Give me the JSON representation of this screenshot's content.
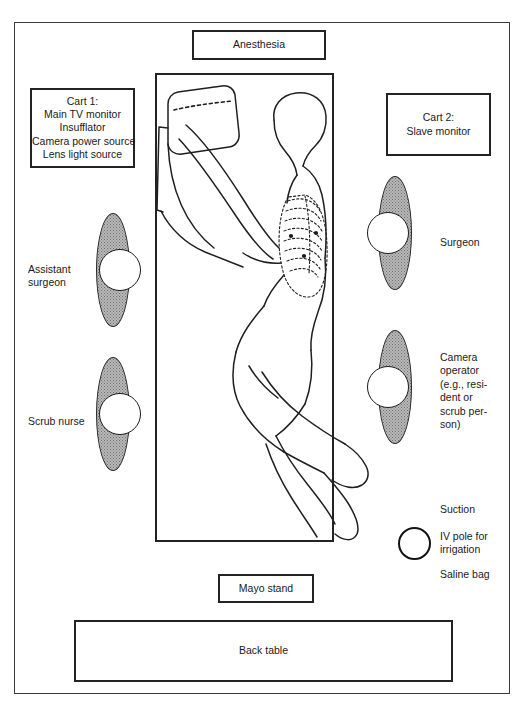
{
  "diagram": {
    "equipment_boxes": [
      {
        "name": "anesthesia",
        "lines": [
          "Anesthesia"
        ]
      },
      {
        "name": "cart-1",
        "lines": [
          "Cart 1:",
          "Main TV monitor",
          "Insufflator",
          "Camera power source",
          "Lens light source"
        ]
      },
      {
        "name": "cart-2",
        "lines": [
          "Cart 2:",
          "Slave monitor"
        ]
      },
      {
        "name": "mayo-stand",
        "lines": [
          "Mayo stand"
        ]
      },
      {
        "name": "back-table",
        "lines": [
          "Back table"
        ]
      }
    ],
    "personnel": [
      {
        "name": "assistant-surgeon",
        "lines": [
          "Assistant",
          "surgeon"
        ]
      },
      {
        "name": "scrub-nurse",
        "lines": [
          "Scrub nurse"
        ]
      },
      {
        "name": "surgeon",
        "lines": [
          "Surgeon"
        ]
      },
      {
        "name": "camera-operator",
        "lines": [
          "Camera",
          "operator",
          "(e.g., resi-",
          "dent or",
          "scrub per-",
          "son)"
        ]
      }
    ],
    "supplies": [
      {
        "name": "suction",
        "lines": [
          "Suction"
        ]
      },
      {
        "name": "iv-pole",
        "lines": [
          "IV pole for",
          "irrigation"
        ]
      },
      {
        "name": "saline-bag",
        "lines": [
          "Saline bag"
        ]
      }
    ],
    "patient": {
      "name": "patient-lateral-decubitus",
      "description": "Patient in lateral decubitus position with arm elevated over drape support and ribs outlined"
    },
    "operating_table": {
      "name": "operating-table"
    },
    "colors": {
      "line": "#232323",
      "person_fill": "#b9b9b9",
      "background": "#ffffff"
    }
  }
}
